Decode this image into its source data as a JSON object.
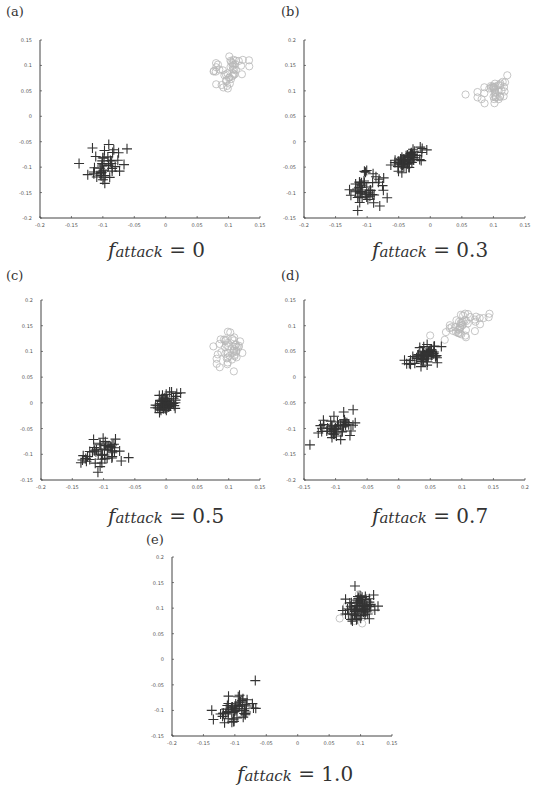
{
  "figure": {
    "panels": [
      {
        "id": "a",
        "label": "(a)",
        "caption_var": "f",
        "caption_sub": "attack",
        "caption_eq": " = 0"
      },
      {
        "id": "b",
        "label": "(b)",
        "caption_var": "f",
        "caption_sub": "attack",
        "caption_eq": " = 0.3"
      },
      {
        "id": "c",
        "label": "(c)",
        "caption_var": "f",
        "caption_sub": "attack",
        "caption_eq": " = 0.5"
      },
      {
        "id": "d",
        "label": "(d)",
        "caption_var": "f",
        "caption_sub": "attack",
        "caption_eq": " = 0.7"
      },
      {
        "id": "e",
        "label": "(e)",
        "caption_var": "f",
        "caption_sub": "attack",
        "caption_eq": " = 1.0"
      }
    ]
  },
  "chart_data": [
    {
      "type": "scatter",
      "title": "(a) f_attack = 0",
      "xlabel": "",
      "ylabel": "",
      "xlim": [
        -0.2,
        0.15
      ],
      "ylim": [
        -0.2,
        0.15
      ],
      "xticks": [
        "-0.2",
        "-0.15",
        "-0.1",
        "-0.05",
        "0",
        "0.05",
        "0.1",
        "0.15"
      ],
      "yticks": [
        "-0.2",
        "-0.15",
        "-0.1",
        "-0.05",
        "0",
        "0.05",
        "0.1",
        "0.15"
      ],
      "grid": false,
      "series": [
        {
          "name": "circles (light gray)",
          "marker": "circle",
          "color": "#b8b8b8",
          "clusters": [
            {
              "center": [
                0.1,
                0.09
              ],
              "spread": [
                0.025,
                0.025
              ],
              "count": 45
            }
          ]
        },
        {
          "name": "crosses (dark)",
          "marker": "plus",
          "color": "#333333",
          "clusters": [
            {
              "center": [
                -0.1,
                -0.1
              ],
              "spread": [
                0.025,
                0.025
              ],
              "count": 45
            }
          ]
        }
      ]
    },
    {
      "type": "scatter",
      "title": "(b) f_attack = 0.3",
      "xlabel": "",
      "ylabel": "",
      "xlim": [
        -0.2,
        0.15
      ],
      "ylim": [
        -0.15,
        0.2
      ],
      "xticks": [
        "-0.2",
        "-0.15",
        "-0.1",
        "-0.05",
        "0",
        "0.05",
        "0.1",
        "0.15"
      ],
      "yticks": [
        "-0.15",
        "-0.1",
        "-0.05",
        "0",
        "0.05",
        "0.1",
        "0.15",
        "0.2"
      ],
      "grid": false,
      "series": [
        {
          "name": "circles (light gray)",
          "marker": "circle",
          "color": "#b8b8b8",
          "clusters": [
            {
              "center": [
                0.1,
                0.095
              ],
              "spread": [
                0.022,
                0.02
              ],
              "count": 40
            }
          ]
        },
        {
          "name": "crosses (dark)",
          "marker": "plus",
          "color": "#333333",
          "clusters": [
            {
              "center": [
                -0.1,
                -0.095
              ],
              "spread": [
                0.025,
                0.025
              ],
              "count": 50
            },
            {
              "center": [
                -0.035,
                -0.035
              ],
              "spread": [
                0.018,
                0.015
              ],
              "count": 60
            }
          ]
        }
      ]
    },
    {
      "type": "scatter",
      "title": "(c) f_attack = 0.5",
      "xlabel": "",
      "ylabel": "",
      "xlim": [
        -0.2,
        0.15
      ],
      "ylim": [
        -0.15,
        0.2
      ],
      "xticks": [
        "-0.2",
        "-0.15",
        "-0.1",
        "-0.05",
        "0",
        "0.05",
        "0.1",
        "0.15"
      ],
      "yticks": [
        "-0.15",
        "-0.1",
        "-0.05",
        "0",
        "0.05",
        "0.1",
        "0.15",
        "0.2"
      ],
      "grid": false,
      "series": [
        {
          "name": "circles (light gray)",
          "marker": "circle",
          "color": "#b8b8b8",
          "clusters": [
            {
              "center": [
                0.1,
                0.1
              ],
              "spread": [
                0.025,
                0.025
              ],
              "count": 45
            }
          ]
        },
        {
          "name": "crosses (dark)",
          "marker": "plus",
          "color": "#333333",
          "clusters": [
            {
              "center": [
                -0.1,
                -0.1
              ],
              "spread": [
                0.025,
                0.025
              ],
              "count": 50
            },
            {
              "center": [
                0.0,
                0.0
              ],
              "spread": [
                0.015,
                0.015
              ],
              "count": 60
            }
          ]
        }
      ]
    },
    {
      "type": "scatter",
      "title": "(d) f_attack = 0.7",
      "xlabel": "",
      "ylabel": "",
      "xlim": [
        -0.15,
        0.2
      ],
      "ylim": [
        -0.2,
        0.15
      ],
      "xticks": [
        "-0.15",
        "-0.1",
        "-0.05",
        "0",
        "0.05",
        "0.1",
        "0.15",
        "0.2"
      ],
      "yticks": [
        "-0.2",
        "-0.15",
        "-0.1",
        "-0.05",
        "0",
        "0.05",
        "0.1",
        "0.15"
      ],
      "grid": false,
      "series": [
        {
          "name": "circles (light gray)",
          "marker": "circle",
          "color": "#b8b8b8",
          "clusters": [
            {
              "center": [
                0.1,
                0.1
              ],
              "spread": [
                0.03,
                0.02
              ],
              "count": 45
            }
          ]
        },
        {
          "name": "crosses (dark)",
          "marker": "plus",
          "color": "#333333",
          "clusters": [
            {
              "center": [
                -0.1,
                -0.1
              ],
              "spread": [
                0.025,
                0.02
              ],
              "count": 50
            },
            {
              "center": [
                0.04,
                0.04
              ],
              "spread": [
                0.02,
                0.016
              ],
              "count": 60
            }
          ]
        }
      ]
    },
    {
      "type": "scatter",
      "title": "(e) f_attack = 1.0",
      "xlabel": "",
      "ylabel": "",
      "xlim": [
        -0.2,
        0.15
      ],
      "ylim": [
        -0.15,
        0.2
      ],
      "xticks": [
        "-0.2",
        "-0.15",
        "-0.1",
        "-0.05",
        "0",
        "0.05",
        "0.1",
        "0.15"
      ],
      "yticks": [
        "-0.15",
        "-0.1",
        "-0.05",
        "0",
        "0.05",
        "0.1",
        "0.15",
        "0.2"
      ],
      "grid": false,
      "series": [
        {
          "name": "circles (light gray)",
          "marker": "circle",
          "color": "#b8b8b8",
          "clusters": [
            {
              "center": [
                0.1,
                0.1
              ],
              "spread": [
                0.02,
                0.02
              ],
              "count": 20
            }
          ]
        },
        {
          "name": "crosses (dark)",
          "marker": "plus",
          "color": "#333333",
          "clusters": [
            {
              "center": [
                -0.1,
                -0.1
              ],
              "spread": [
                0.025,
                0.022
              ],
              "count": 55
            },
            {
              "center": [
                0.1,
                0.1
              ],
              "spread": [
                0.02,
                0.02
              ],
              "count": 70
            }
          ]
        }
      ]
    }
  ],
  "layout": {
    "plots": [
      {
        "left": 40,
        "top": 40,
        "width": 220,
        "height": 178,
        "label_x": 6,
        "label_y": 4,
        "caption_x": 108,
        "caption_y": 238
      },
      {
        "left": 304,
        "top": 40,
        "width": 221,
        "height": 178,
        "label_x": 281,
        "label_y": 4,
        "caption_x": 372,
        "caption_y": 238
      },
      {
        "left": 41,
        "top": 300,
        "width": 219,
        "height": 180,
        "label_x": 6,
        "label_y": 268,
        "caption_x": 108,
        "caption_y": 504
      },
      {
        "left": 304,
        "top": 300,
        "width": 221,
        "height": 180,
        "label_x": 281,
        "label_y": 268,
        "caption_x": 372,
        "caption_y": 504
      },
      {
        "left": 172,
        "top": 557,
        "width": 220,
        "height": 179,
        "label_x": 146,
        "label_y": 532,
        "caption_x": 237,
        "caption_y": 762
      }
    ]
  }
}
